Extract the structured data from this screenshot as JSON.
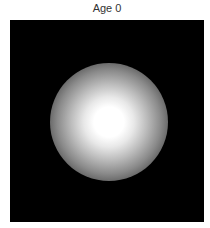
{
  "title": "Age 0",
  "image": {
    "description": "Radial white glow on black background",
    "background_color": "#000000",
    "glow_color": "#ffffff"
  }
}
